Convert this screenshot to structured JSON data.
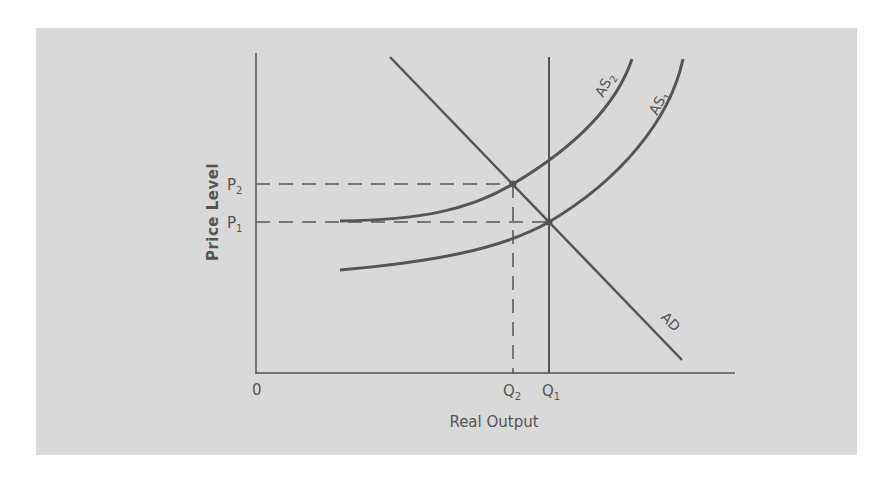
{
  "diagram": {
    "type": "economics-supply-demand",
    "colors": {
      "background": "#ffffff",
      "panel": "#d9d9d9",
      "line": "#555555",
      "text": "#555555"
    },
    "axes": {
      "x_label": "Real Output",
      "y_label": "Price Level",
      "origin_label": "0"
    },
    "price_levels": [
      {
        "id": "P2",
        "base": "P",
        "sub": "2"
      },
      {
        "id": "P1",
        "base": "P",
        "sub": "1"
      }
    ],
    "quantities": [
      {
        "id": "Q2",
        "base": "Q",
        "sub": "2"
      },
      {
        "id": "Q1",
        "base": "Q",
        "sub": "1"
      }
    ],
    "curves": [
      {
        "id": "AS2",
        "base": "AS",
        "sub": "2",
        "kind": "aggregate supply (shifted)"
      },
      {
        "id": "AS1",
        "base": "AS",
        "sub": "1",
        "kind": "aggregate supply (original)"
      },
      {
        "id": "AD",
        "label": "AD",
        "kind": "aggregate demand"
      }
    ],
    "equilibria": [
      {
        "point": "E1",
        "price": "P1",
        "output": "Q1",
        "curves": [
          "AS1",
          "AD"
        ]
      },
      {
        "point": "E2",
        "price": "P2",
        "output": "Q2",
        "curves": [
          "AS2",
          "AD"
        ]
      }
    ],
    "vertical_line": {
      "at": "Q1",
      "kind": "potential output"
    }
  }
}
